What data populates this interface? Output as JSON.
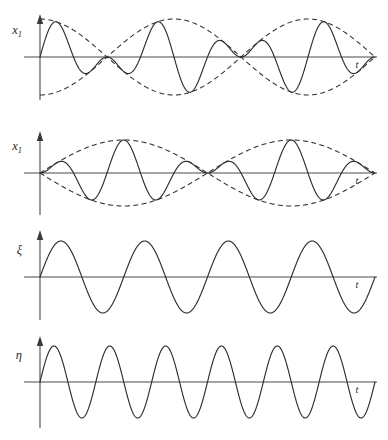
{
  "figure": {
    "title": "",
    "background_color": "#ffffff",
    "line_color": "#2e2e2e",
    "axis_color": "#4a4a4a",
    "width": 388,
    "height": 440
  },
  "panels": [
    {
      "id": "panel-1",
      "y_label": "x",
      "y_label_sub": "1",
      "x_label": "t",
      "baseline_y": 57,
      "axis_x": 40,
      "axis_top": 16,
      "axis_bottom": 100,
      "x_start": 40,
      "x_end": 375,
      "amplitude": 38,
      "envelope_style": "dashed",
      "envelope_type": "cosine",
      "envelope_cycles": 1.25,
      "carrier_cycles": 5,
      "description": "beat: carrier modulated by cosine envelope"
    },
    {
      "id": "panel-2",
      "y_label": "x",
      "y_label_sub": "1",
      "x_label": "t",
      "baseline_y": 173,
      "axis_x": 40,
      "axis_top": 133,
      "axis_bottom": 215,
      "x_start": 40,
      "x_end": 375,
      "amplitude": 33,
      "envelope_style": "dashed",
      "envelope_type": "sine",
      "envelope_cycles": 1.0,
      "carrier_cycles": 5,
      "description": "beat: carrier modulated by sine envelope, two lobes"
    },
    {
      "id": "panel-3",
      "y_label": "ξ",
      "y_label_sub": "",
      "x_label": "t",
      "baseline_y": 277,
      "axis_x": 40,
      "axis_top": 232,
      "axis_bottom": 320,
      "x_start": 40,
      "x_end": 375,
      "amplitude": 36,
      "envelope_style": "none",
      "envelope_type": "",
      "envelope_cycles": 0,
      "carrier_cycles": 4,
      "description": "pure sine wave, four cycles"
    },
    {
      "id": "panel-4",
      "y_label": "η",
      "y_label_sub": "",
      "x_label": "t",
      "baseline_y": 382,
      "axis_x": 40,
      "axis_top": 338,
      "axis_bottom": 428,
      "x_start": 40,
      "x_end": 375,
      "amplitude": 36,
      "envelope_style": "none",
      "envelope_type": "",
      "envelope_cycles": 0,
      "carrier_cycles": 6,
      "description": "pure sine wave, six cycles"
    }
  ],
  "chart_data": {
    "type": "line",
    "title": "",
    "xlabel": "t",
    "ylabel": "",
    "grid": false,
    "legend": "none",
    "subplots": [
      {
        "name": "panel-1",
        "ylabel": "x₁",
        "xlabel": "t",
        "series": [
          {
            "name": "superposition",
            "style": "solid",
            "formula": "A*cos(2*pi*1.25*u)*sin(2*pi*5*u)",
            "amplitude": 1.0,
            "carrier_cycles": 5,
            "envelope_cycles": 1.25,
            "envelope_phase": "cosine"
          },
          {
            "name": "envelope-upper",
            "style": "dashed",
            "formula": "+A*cos(2*pi*1.25*u)"
          },
          {
            "name": "envelope-lower",
            "style": "dashed",
            "formula": "-A*cos(2*pi*1.25*u)"
          }
        ],
        "xlim": [
          0,
          1
        ],
        "ylim": [
          -1.1,
          1.1
        ]
      },
      {
        "name": "panel-2",
        "ylabel": "x₁",
        "xlabel": "t",
        "series": [
          {
            "name": "superposition",
            "style": "solid",
            "formula": "A*sin(2*pi*1.0*u)*sin(2*pi*5*u)",
            "amplitude": 1.0,
            "carrier_cycles": 5,
            "envelope_cycles": 1.0,
            "envelope_phase": "sine"
          },
          {
            "name": "envelope-upper",
            "style": "dashed",
            "formula": "+A*sin(2*pi*1.0*u)"
          },
          {
            "name": "envelope-lower",
            "style": "dashed",
            "formula": "-A*sin(2*pi*1.0*u)"
          }
        ],
        "xlim": [
          0,
          1
        ],
        "ylim": [
          -1.1,
          1.1
        ]
      },
      {
        "name": "panel-3",
        "ylabel": "ξ",
        "xlabel": "t",
        "series": [
          {
            "name": "xi",
            "style": "solid",
            "formula": "A*sin(2*pi*4*u)",
            "amplitude": 1.0,
            "cycles": 4
          }
        ],
        "xlim": [
          0,
          1
        ],
        "ylim": [
          -1.1,
          1.1
        ]
      },
      {
        "name": "panel-4",
        "ylabel": "η",
        "xlabel": "t",
        "series": [
          {
            "name": "eta",
            "style": "solid",
            "formula": "A*sin(2*pi*6*u)",
            "amplitude": 1.0,
            "cycles": 6
          }
        ],
        "xlim": [
          0,
          1
        ],
        "ylim": [
          -1.1,
          1.1
        ]
      }
    ]
  }
}
